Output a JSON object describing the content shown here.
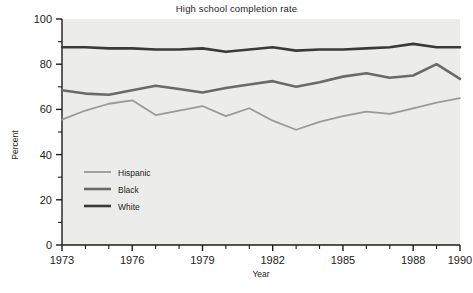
{
  "chart_data": {
    "type": "line",
    "title": "High school completion rate",
    "xlabel": "Year",
    "ylabel": "Percent",
    "xlim": [
      1973,
      1990
    ],
    "ylim": [
      0,
      100
    ],
    "xticks": [
      1973,
      1976,
      1979,
      1982,
      1985,
      1988,
      1990
    ],
    "xtick_labels": [
      "1973",
      "1976",
      "1979",
      "1982",
      "1985",
      "1988",
      "1990"
    ],
    "xminor_step": 1,
    "yticks": [
      0,
      20,
      40,
      60,
      80,
      100
    ],
    "ytick_labels": [
      "0",
      "20",
      "40",
      "60",
      "80",
      "100"
    ],
    "yminor_step": 10,
    "grid": false,
    "legend_position": "lower-left-inside",
    "x": [
      1973,
      1974,
      1975,
      1976,
      1977,
      1978,
      1979,
      1980,
      1981,
      1982,
      1983,
      1984,
      1985,
      1986,
      1987,
      1988,
      1989,
      1990
    ],
    "series": [
      {
        "name": "Hispanic",
        "color": "#9a9a96",
        "width": 1.8,
        "values": [
          55.5,
          59.5,
          62.5,
          64.0,
          57.5,
          59.5,
          61.5,
          57.0,
          60.5,
          55.0,
          51.0,
          54.5,
          57.0,
          59.0,
          58.0,
          60.5,
          63.0,
          65.0
        ]
      },
      {
        "name": "Black",
        "color": "#6a6a66",
        "width": 2.6,
        "values": [
          68.5,
          67.0,
          66.5,
          68.5,
          70.5,
          69.0,
          67.5,
          69.5,
          71.0,
          72.5,
          70.0,
          72.0,
          74.5,
          76.0,
          74.0,
          75.0,
          80.0,
          73.5
        ]
      },
      {
        "name": "White",
        "color": "#3a3a36",
        "width": 2.6,
        "values": [
          87.5,
          87.5,
          87.0,
          87.0,
          86.5,
          86.5,
          87.0,
          85.5,
          86.5,
          87.5,
          86.0,
          86.5,
          86.5,
          87.0,
          87.5,
          89.0,
          87.5,
          87.5
        ]
      }
    ],
    "series_hispanic_late": [
      63.0,
      65.0,
      65.5,
      64.0,
      58.5,
      54.0,
      59.5,
      59.0
    ],
    "series_black_late": [
      76.0,
      74.0,
      75.0,
      80.0,
      73.5,
      76.0,
      78.5
    ],
    "series_white_late": [
      87.0,
      87.5,
      89.0,
      87.5,
      87.5,
      88.0,
      88.0
    ]
  },
  "legend": {
    "items": [
      {
        "label": "Hispanic"
      },
      {
        "label": "Black"
      },
      {
        "label": "White"
      }
    ]
  }
}
